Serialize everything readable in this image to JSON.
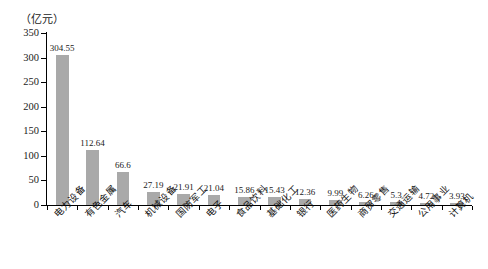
{
  "chart_data": {
    "type": "bar",
    "title": "",
    "unit_label": "（亿元）",
    "xlabel": "",
    "ylabel": "",
    "ylim": [
      0,
      350
    ],
    "yticks": [
      0,
      50,
      100,
      150,
      200,
      250,
      300,
      350
    ],
    "grid": false,
    "legend": false,
    "bar_color": "#a9a9a9",
    "categories": [
      "电力设备",
      "有色金属",
      "汽车",
      "机械设备",
      "国防军工",
      "电子",
      "食品饮料",
      "基础化工",
      "银行",
      "医药生物",
      "商贸零售",
      "交通运输",
      "公用事业",
      "计算机"
    ],
    "values": [
      304.55,
      112.64,
      66.6,
      27.19,
      21.91,
      21.04,
      15.86,
      15.43,
      12.36,
      9.99,
      6.26,
      5.3,
      4.72,
      3.93
    ],
    "value_labels": [
      "304.55",
      "112.64",
      "66.6",
      "27.19",
      "21.91",
      "21.04",
      "15.86",
      "15.43",
      "12.36",
      "9.99",
      "6.26",
      "5.3",
      "4.72",
      "3.93"
    ],
    "ytick_labels": [
      "0",
      "50",
      "100",
      "150",
      "200",
      "250",
      "300",
      "350"
    ]
  }
}
